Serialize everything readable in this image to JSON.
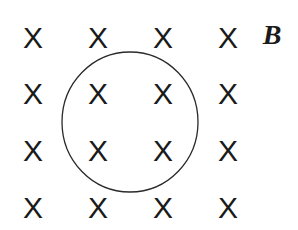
{
  "diagram": {
    "field_label": "B",
    "field_symbol": "X",
    "grid": {
      "columns_x": [
        33,
        98,
        163,
        228
      ],
      "rows_y": [
        38,
        94,
        151,
        208
      ]
    },
    "loop": {
      "cx": 130,
      "cy": 122,
      "rx": 68,
      "ry": 70,
      "stroke": "#2a2a2a"
    },
    "label_position": {
      "x": 272,
      "y": 35
    }
  }
}
